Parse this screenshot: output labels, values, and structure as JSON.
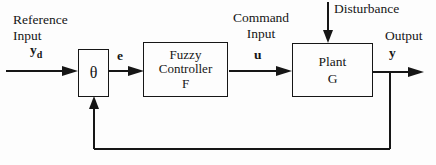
{
  "diagram": {
    "colors": {
      "background": "#fdfdfd",
      "line": "#161616"
    },
    "labels": {
      "reference_line1": "Reference",
      "reference_line2": "Input",
      "reference_signal": "y",
      "reference_signal_sub": "d",
      "error_signal": "e",
      "command_line1": "Command",
      "command_line2": "Input",
      "command_signal": "u",
      "disturbance": "Disturbance",
      "output": "Output",
      "output_signal": "y"
    },
    "blocks": {
      "summing": {
        "symbol": "θ"
      },
      "controller": {
        "line1": "Fuzzy",
        "line2": "Controller",
        "line3": "F"
      },
      "plant": {
        "line1": "Plant",
        "line2": "G"
      }
    }
  }
}
